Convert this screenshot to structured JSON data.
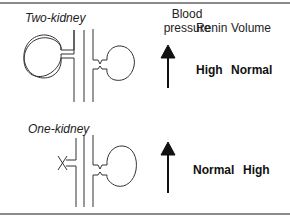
{
  "headers": {
    "blood_pressure": "Blood\npressure",
    "blood_pressure_line1": "Blood",
    "blood_pressure_line2": "pressure",
    "renin": "Renin",
    "volume": "Volume"
  },
  "models": [
    {
      "label": "Two-kidney",
      "blood_pressure_icon": "up-arrow-icon",
      "renin": "High",
      "volume": "Normal"
    },
    {
      "label": "One-kidney",
      "blood_pressure_icon": "up-arrow-icon",
      "renin": "Normal",
      "volume": "High"
    }
  ],
  "colors": {
    "ink": "#222222",
    "rule": "#8a8a8a",
    "background": "#ffffff"
  }
}
